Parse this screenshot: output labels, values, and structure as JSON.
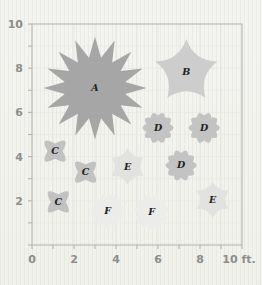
{
  "figure": {
    "title": "",
    "background_color": "#f2f2ee",
    "frame_color": "#b9b9b4",
    "axis_text_color": "#8d8d8d",
    "label_text_color": "#222222"
  },
  "axes": {
    "x_unit_label": "10 ft.",
    "x_ticks": [
      "0",
      "2",
      "4",
      "6",
      "8"
    ],
    "y_ticks": [
      "2",
      "4",
      "6",
      "8",
      "10"
    ],
    "x_range": [
      0,
      10
    ],
    "y_range": [
      0,
      10
    ],
    "x_minor_step": 1,
    "y_minor_step": 1,
    "grid": false
  },
  "chart_data": {
    "type": "scatter",
    "title": "",
    "xlabel": "10 ft.",
    "ylabel": "",
    "xlim": [
      0,
      10
    ],
    "ylim": [
      0,
      10
    ],
    "legend": "none",
    "note": "Planting plan: flower/plant symbols placed on a 10 ft x 10 ft garden grid. Symbol letter = plant type, symbol size = spread.",
    "categories": [
      "A",
      "B",
      "C",
      "D",
      "E",
      "F"
    ],
    "symbol_types": {
      "A": {
        "shape": "spiky-star",
        "points": 16,
        "color": "#a6a6a6",
        "radius_ft": 2.45
      },
      "B": {
        "shape": "five-point-flower",
        "points": 5,
        "color": "#cdcdcd",
        "radius_ft": 1.55
      },
      "C": {
        "shape": "four-petal-clover",
        "points": 4,
        "color": "#c2c2c2",
        "radius_ft": 0.92
      },
      "D": {
        "shape": "round-many-petal-flower",
        "points": 10,
        "color": "#c3c3c3",
        "radius_ft": 0.92
      },
      "E": {
        "shape": "six-point-star",
        "points": 6,
        "color": "#e2e2e0",
        "radius_ft": 0.88
      },
      "F": {
        "shape": "round-many-petal-flower",
        "points": 11,
        "color": "#ececea",
        "radius_ft": 1.02
      }
    },
    "points": [
      {
        "label": "A",
        "x": 3.0,
        "y": 7.1,
        "type": "A"
      },
      {
        "label": "B",
        "x": 7.35,
        "y": 7.85,
        "type": "B"
      },
      {
        "label": "D",
        "x": 6.0,
        "y": 5.3,
        "type": "D"
      },
      {
        "label": "D",
        "x": 8.2,
        "y": 5.3,
        "type": "D"
      },
      {
        "label": "D",
        "x": 7.1,
        "y": 3.6,
        "type": "D"
      },
      {
        "label": "C",
        "x": 1.1,
        "y": 4.25,
        "type": "C"
      },
      {
        "label": "C",
        "x": 2.55,
        "y": 3.3,
        "type": "C"
      },
      {
        "label": "C",
        "x": 1.25,
        "y": 1.95,
        "type": "C"
      },
      {
        "label": "E",
        "x": 4.55,
        "y": 3.55,
        "type": "E"
      },
      {
        "label": "E",
        "x": 8.6,
        "y": 2.05,
        "type": "E"
      },
      {
        "label": "F",
        "x": 3.6,
        "y": 1.55,
        "type": "F"
      },
      {
        "label": "F",
        "x": 5.7,
        "y": 1.5,
        "type": "F"
      }
    ]
  }
}
